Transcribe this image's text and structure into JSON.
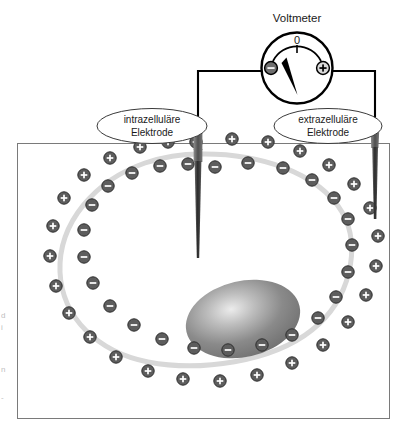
{
  "figure": {
    "title": "Voltmeter",
    "language": "de"
  },
  "voltmeter": {
    "label": "Voltmeter",
    "zero_mark": "0",
    "minus_terminal": "–",
    "plus_terminal": "+",
    "needle_direction": "up-left"
  },
  "callouts": [
    {
      "id": "intracellular",
      "line1": "intrazelluläre",
      "line2": "Elektrode"
    },
    {
      "id": "extracellular",
      "line1": "extrazelluläre",
      "line2": "Elektrode"
    }
  ],
  "electrodes": [
    {
      "id": "intracellular-electrode",
      "position": "inside-cell"
    },
    {
      "id": "extracellular-electrode",
      "position": "outside-cell"
    }
  ],
  "symbols": {
    "negative": "–",
    "positive": "+"
  },
  "colors": {
    "charge_fill": "#5d5d5d",
    "charge_glyph": "#ffffff",
    "membrane": "#d6d6d6",
    "nucleus_edge": "#6b6b6b",
    "nucleus_core": "#e9e9e9",
    "electrode": "#111111",
    "electrode_cap": "#4a4a4a",
    "wire": "#000000",
    "box_border": "#7a7a7a"
  },
  "chart_data": {
    "type": "diagram",
    "title": "Voltmeter",
    "inner_charges": [
      {
        "x": 215,
        "y": 167,
        "sign": "-"
      },
      {
        "x": 248,
        "y": 163,
        "sign": "-"
      },
      {
        "x": 283,
        "y": 168,
        "sign": "-"
      },
      {
        "x": 312,
        "y": 180,
        "sign": "-"
      },
      {
        "x": 334,
        "y": 198,
        "sign": "-"
      },
      {
        "x": 348,
        "y": 219,
        "sign": "-"
      },
      {
        "x": 352,
        "y": 245,
        "sign": "-"
      },
      {
        "x": 348,
        "y": 272,
        "sign": "-"
      },
      {
        "x": 336,
        "y": 297,
        "sign": "-"
      },
      {
        "x": 318,
        "y": 318,
        "sign": "-"
      },
      {
        "x": 292,
        "y": 335,
        "sign": "-"
      },
      {
        "x": 262,
        "y": 345,
        "sign": "-"
      },
      {
        "x": 228,
        "y": 350,
        "sign": "-"
      },
      {
        "x": 194,
        "y": 348,
        "sign": "-"
      },
      {
        "x": 162,
        "y": 339,
        "sign": "-"
      },
      {
        "x": 134,
        "y": 325,
        "sign": "-"
      },
      {
        "x": 110,
        "y": 306,
        "sign": "-"
      },
      {
        "x": 93,
        "y": 283,
        "sign": "-"
      },
      {
        "x": 84,
        "y": 257,
        "sign": "-"
      },
      {
        "x": 84,
        "y": 230,
        "sign": "-"
      },
      {
        "x": 92,
        "y": 205,
        "sign": "-"
      },
      {
        "x": 108,
        "y": 186,
        "sign": "-"
      },
      {
        "x": 132,
        "y": 173,
        "sign": "-"
      },
      {
        "x": 160,
        "y": 166,
        "sign": "-"
      },
      {
        "x": 188,
        "y": 164,
        "sign": "-"
      }
    ],
    "outer_charges": [
      {
        "x": 196,
        "y": 142,
        "sign": "+"
      },
      {
        "x": 232,
        "y": 139,
        "sign": "+"
      },
      {
        "x": 268,
        "y": 142,
        "sign": "+"
      },
      {
        "x": 300,
        "y": 151,
        "sign": "+"
      },
      {
        "x": 329,
        "y": 165,
        "sign": "+"
      },
      {
        "x": 354,
        "y": 184,
        "sign": "+"
      },
      {
        "x": 370,
        "y": 208,
        "sign": "+"
      },
      {
        "x": 378,
        "y": 236,
        "sign": "+"
      },
      {
        "x": 376,
        "y": 266,
        "sign": "+"
      },
      {
        "x": 366,
        "y": 295,
        "sign": "+"
      },
      {
        "x": 348,
        "y": 322,
        "sign": "+"
      },
      {
        "x": 323,
        "y": 345,
        "sign": "+"
      },
      {
        "x": 292,
        "y": 363,
        "sign": "+"
      },
      {
        "x": 257,
        "y": 375,
        "sign": "+"
      },
      {
        "x": 220,
        "y": 381,
        "sign": "+"
      },
      {
        "x": 183,
        "y": 379,
        "sign": "+"
      },
      {
        "x": 148,
        "y": 371,
        "sign": "+"
      },
      {
        "x": 116,
        "y": 357,
        "sign": "+"
      },
      {
        "x": 90,
        "y": 337,
        "sign": "+"
      },
      {
        "x": 69,
        "y": 313,
        "sign": "+"
      },
      {
        "x": 56,
        "y": 286,
        "sign": "+"
      },
      {
        "x": 50,
        "y": 256,
        "sign": "+"
      },
      {
        "x": 53,
        "y": 226,
        "sign": "+"
      },
      {
        "x": 64,
        "y": 198,
        "sign": "+"
      },
      {
        "x": 84,
        "y": 175,
        "sign": "+"
      },
      {
        "x": 110,
        "y": 158,
        "sign": "+"
      },
      {
        "x": 140,
        "y": 147,
        "sign": "+"
      },
      {
        "x": 168,
        "y": 142,
        "sign": "+"
      }
    ]
  }
}
